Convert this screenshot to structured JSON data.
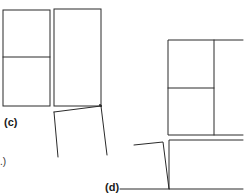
{
  "figure": {
    "labels": {
      "c": "(c)",
      "d": "(d)",
      "partial_left": ".)"
    },
    "stroke_color": "#2a2a2a",
    "background": "#ffffff"
  }
}
